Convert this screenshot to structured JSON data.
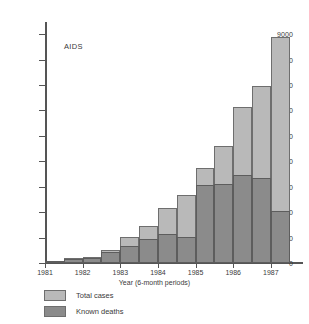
{
  "chart_data": {
    "type": "bar",
    "title": "AIDS",
    "xlabel": "Year  (6-month periods)",
    "ylabel": "Cases",
    "ylim": [
      0,
      9400
    ],
    "ytick_values": [
      0,
      1000,
      2000,
      3000,
      4000,
      5000,
      6000,
      7000,
      8000,
      9000
    ],
    "ytick_labels": [
      "0",
      "1000",
      "2000",
      "3000",
      "4000",
      "5000",
      "6000",
      "7000",
      "8000",
      "9000"
    ],
    "xtick_labels": [
      "1981",
      "1982",
      "1983",
      "1984",
      "1985",
      "1986",
      "1987"
    ],
    "grid": false,
    "stacked": true,
    "legend_position": "below-left",
    "categories": [
      "1981 H1",
      "1981 H2",
      "1982 H1",
      "1982 H2",
      "1983 H1",
      "1983 H2",
      "1984 H1",
      "1984 H2",
      "1985 H1",
      "1985 H2",
      "1986 H1",
      "1986 H2",
      "1987 H1"
    ],
    "series": [
      {
        "name": "Total cases",
        "color": "#b9b9b9",
        "values": [
          20,
          180,
          250,
          520,
          1010,
          1440,
          2160,
          2690,
          3720,
          4620,
          6130,
          6960,
          8880
        ]
      },
      {
        "name": "Known deaths",
        "color": "#8b8b8b",
        "values": [
          10,
          140,
          200,
          420,
          680,
          950,
          1150,
          1020,
          3060,
          3110,
          3460,
          3340,
          2040
        ]
      }
    ]
  },
  "legend": {
    "items": [
      {
        "label": "Total cases",
        "color": "#b9b9b9"
      },
      {
        "label": "Known deaths",
        "color": "#8b8b8b"
      }
    ]
  },
  "annotations": {
    "aids_label": "AIDS"
  }
}
